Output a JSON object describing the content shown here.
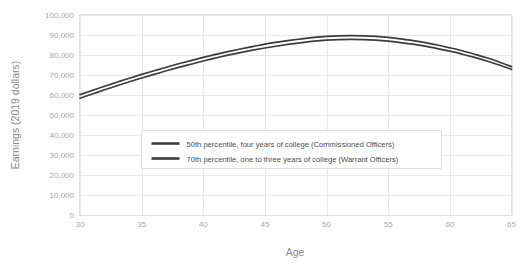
{
  "chart_data": {
    "type": "line",
    "title": "",
    "xlabel": "Age",
    "ylabel": "Earnings (2019 dollars)",
    "xlim": [
      30,
      65
    ],
    "ylim": [
      0,
      100000
    ],
    "grid": true,
    "legend_position": "center-left-inside",
    "x_ticks": [
      "30",
      "35",
      "40",
      "45",
      "50",
      "55",
      "60",
      "65"
    ],
    "x_tick_values": [
      30,
      35,
      40,
      45,
      50,
      55,
      60,
      65
    ],
    "y_ticks": [
      "0",
      "10,000",
      "20,000",
      "30,000",
      "40,000",
      "50,000",
      "60,000",
      "70,000",
      "80,000",
      "90,000",
      "100,000"
    ],
    "y_tick_values": [
      0,
      10000,
      20000,
      30000,
      40000,
      50000,
      60000,
      70000,
      80000,
      90000,
      100000
    ],
    "x": [
      30,
      31,
      32,
      33,
      34,
      35,
      36,
      37,
      38,
      39,
      40,
      41,
      42,
      43,
      44,
      45,
      46,
      47,
      48,
      49,
      50,
      51,
      52,
      53,
      54,
      55,
      56,
      57,
      58,
      59,
      60,
      61,
      62,
      63,
      64,
      65
    ],
    "series": [
      {
        "name": "50th percentile, four years of college (Commissioned Officers)",
        "color": "#3c3c3c",
        "values": [
          60200,
          62300,
          64400,
          66400,
          68400,
          70300,
          72100,
          73900,
          75600,
          77200,
          78800,
          80300,
          81700,
          83000,
          84200,
          85400,
          86400,
          87300,
          88100,
          88800,
          89300,
          89600,
          89700,
          89600,
          89300,
          88800,
          88100,
          87200,
          86200,
          85000,
          83600,
          82100,
          80400,
          78600,
          76500,
          74200
        ]
      },
      {
        "name": "70th percentile, one to three years of college (Warrant Officers)",
        "color": "#3c3c3c",
        "values": [
          58400,
          60500,
          62600,
          64600,
          66600,
          68500,
          70300,
          72100,
          73800,
          75400,
          77000,
          78500,
          79900,
          81200,
          82400,
          83500,
          84500,
          85400,
          86200,
          86900,
          87400,
          87700,
          87800,
          87700,
          87400,
          86900,
          86200,
          85400,
          84400,
          83200,
          81900,
          80400,
          78800,
          77000,
          75000,
          72800
        ]
      }
    ],
    "legend": [
      {
        "label": "50th percentile, four years of college (Commissioned Officers)",
        "color": "#3c3c3c"
      },
      {
        "label": "70th percentile, one to three years of college (Warrant Officers)",
        "color": "#3c3c3c"
      }
    ],
    "colors": {
      "grid": "#e8e8e8",
      "frame": "#e2e2e2",
      "tick_text": "#a8a8a8",
      "axis_title": "#8a8a8a",
      "legend_text": "#4d4d4d",
      "background": "#ffffff"
    }
  }
}
